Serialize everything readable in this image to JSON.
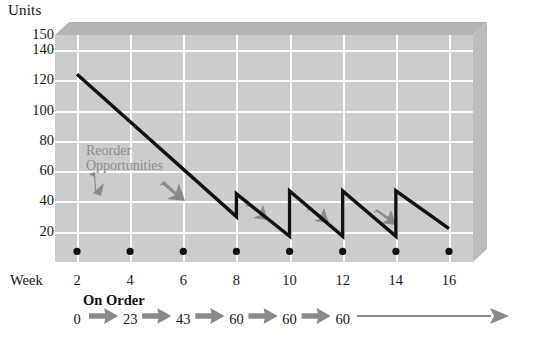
{
  "chart_data": {
    "type": "line",
    "title": "",
    "subtitle": "",
    "ylabel": "Units",
    "xlabel": "Week",
    "ylim": [
      0,
      150
    ],
    "xlim": [
      1,
      17
    ],
    "grid": true,
    "legend_position": "none",
    "y_ticks": [
      {
        "label": "150",
        "value": 150
      },
      {
        "label": "140",
        "value": 140
      },
      {
        "label": "120",
        "value": 120
      },
      {
        "label": "100",
        "value": 100
      },
      {
        "label": "80",
        "value": 80
      },
      {
        "label": "60",
        "value": 60
      },
      {
        "label": "40",
        "value": 40
      },
      {
        "label": "20",
        "value": 20
      }
    ],
    "x_ticks": [
      {
        "label": "2",
        "value": 2
      },
      {
        "label": "4",
        "value": 4
      },
      {
        "label": "6",
        "value": 6
      },
      {
        "label": "8",
        "value": 8
      },
      {
        "label": "10",
        "value": 10
      },
      {
        "label": "12",
        "value": 12
      },
      {
        "label": "14",
        "value": 14
      },
      {
        "label": "16",
        "value": 16
      }
    ],
    "series": [
      {
        "name": "Inventory on hand",
        "color": "#111111",
        "points": [
          {
            "x": 2,
            "y": 124
          },
          {
            "x": 8,
            "y": 30
          },
          {
            "x": 8,
            "y": 45
          },
          {
            "x": 10,
            "y": 17
          },
          {
            "x": 10,
            "y": 47
          },
          {
            "x": 12,
            "y": 17
          },
          {
            "x": 12,
            "y": 47
          },
          {
            "x": 14,
            "y": 17
          },
          {
            "x": 14,
            "y": 47
          },
          {
            "x": 16,
            "y": 22
          }
        ]
      }
    ],
    "markers": {
      "name": "reorder-opportunity-dots",
      "color": "#101010",
      "y": 7,
      "x": [
        2,
        4,
        6,
        8,
        10,
        12,
        14,
        16
      ]
    },
    "annotations": [
      {
        "name": "reorder-opportunities",
        "text_line1": "Reorder",
        "text_line2": "Opportunities",
        "color": "#8a8a8a"
      }
    ]
  },
  "on_order": {
    "title": "On Order",
    "values": [
      {
        "week": 2,
        "label": "0"
      },
      {
        "week": 4,
        "label": "23"
      },
      {
        "week": 6,
        "label": "43"
      },
      {
        "week": 8,
        "label": "60"
      },
      {
        "week": 10,
        "label": "60"
      },
      {
        "week": 12,
        "label": "60"
      }
    ],
    "arrow_color": "#8a8a8a"
  },
  "colors": {
    "plot_face": "#cccccc",
    "bevel_top": "#b4b4b4",
    "bevel_right": "#bdbdbd",
    "gridline": "#fbfbfb",
    "line": "#111111",
    "annotation": "#8a8a8a",
    "background": "#ffffff"
  }
}
